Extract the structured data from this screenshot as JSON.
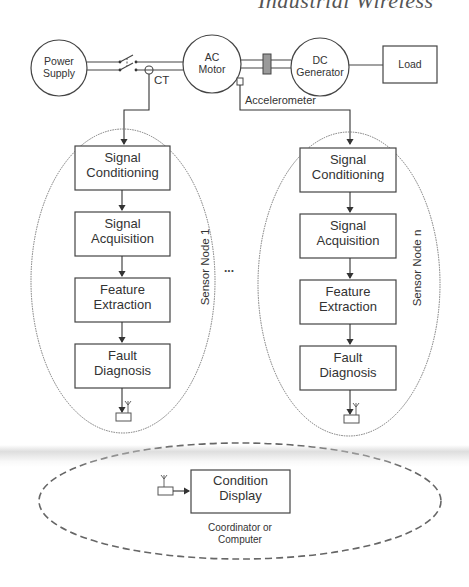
{
  "header": {
    "title_fragment": "Industrial Wireless"
  },
  "drive_train": {
    "power_supply": "Power\nSupply",
    "ac_motor": "AC\nMotor",
    "dc_generator": "DC\nGenerator",
    "load": "Load",
    "ct_label": "CT",
    "accelerometer_label": "Accelerometer"
  },
  "sensor_nodes": [
    {
      "name": "Sensor Node 1",
      "blocks": [
        "Signal\nConditioning",
        "Signal\nAcquisition",
        "Feature\nExtraction",
        "Fault\nDiagnosis"
      ]
    },
    {
      "name": "Sensor Node n",
      "blocks": [
        "Signal\nConditioning",
        "Signal\nAcquisition",
        "Feature\nExtraction",
        "Fault\nDiagnosis"
      ]
    }
  ],
  "ellipsis": "...",
  "coordinator": {
    "block": "Condition\nDisplay",
    "caption": "Coordinator or\nComputer"
  },
  "colors": {
    "line": "#3a3a3a",
    "outline": "#555555",
    "coupling": "#888888"
  }
}
